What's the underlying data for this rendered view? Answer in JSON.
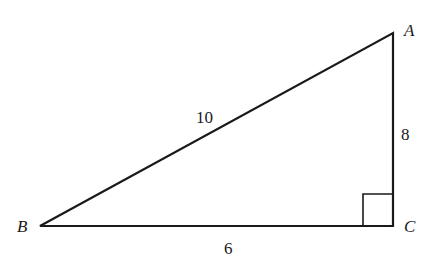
{
  "diagram": {
    "type": "right-triangle",
    "vertices": {
      "A": {
        "label": "A",
        "x": 393,
        "y": 33
      },
      "B": {
        "label": "B",
        "x": 40,
        "y": 226
      },
      "C": {
        "label": "C",
        "x": 393,
        "y": 226
      }
    },
    "sides": {
      "AB": {
        "label": "10"
      },
      "AC": {
        "label": "8"
      },
      "BC": {
        "label": "6"
      }
    },
    "right_angle_at": "C",
    "colors": {
      "stroke": "#1a1a1a",
      "background": "#ffffff"
    }
  }
}
